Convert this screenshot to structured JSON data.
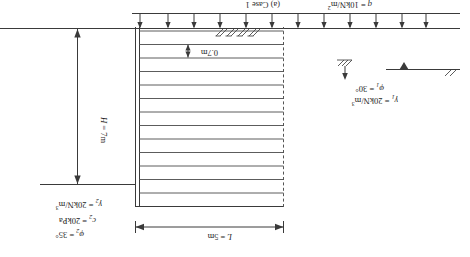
{
  "figure": {
    "caption": "(a) Case 1",
    "type": "reinforced-soil-retaining-wall-cross-section",
    "orientation_note": "180"
  },
  "dimensions": {
    "length_label": "L = 5m",
    "length_value": 5,
    "length_unit": "m",
    "height_label": "H = 7m",
    "height_value": 7,
    "height_unit": "m",
    "spacing_label": "0.7m",
    "spacing_value": 0.7,
    "spacing_unit": "m",
    "reinforcement_layers": 13
  },
  "loads": {
    "surcharge_symbol": "q",
    "surcharge_equals": "=",
    "surcharge_value": "10kN/m",
    "surcharge_exponent": "2",
    "surcharge_full": "q = 10kN/m2",
    "arrow_count": 12,
    "arrow_direction": "up"
  },
  "soil_layer_1": {
    "unit_weight_symbol": "γ",
    "unit_weight_sub": "1",
    "unit_weight_value": "20kN/m",
    "unit_weight_exponent": "3",
    "friction_symbol": "φ",
    "friction_sub": "1",
    "friction_value": "30",
    "friction_unit": "°",
    "unit_weight_full": "γ1 = 20kN/m3",
    "friction_full": "φ1 = 30°"
  },
  "soil_layer_2": {
    "unit_weight_symbol": "γ",
    "unit_weight_sub": "2",
    "unit_weight_value": "20kN/m",
    "unit_weight_exponent": "3",
    "cohesion_symbol": "c",
    "cohesion_sub": "2",
    "cohesion_value": "20kPa",
    "friction_symbol": "φ",
    "friction_sub": "2",
    "friction_value": "35",
    "friction_unit": "°",
    "unit_weight_full": "γ2 = 20kN/m3",
    "cohesion_full": "c2 = 20kPa",
    "friction_full": "φ2 = 35°"
  },
  "equals": "=",
  "icons": {
    "ground_hatch": "ground-hatch-icon",
    "water_table": "water-table-icon",
    "dim_arrow": "dimension-arrow-icon",
    "load_arrow": "load-arrow-icon"
  },
  "colors": {
    "line": "#3a3a3a",
    "thin_line": "#4a4a4a",
    "dash_line": "#555555",
    "text": "#1d1d1d",
    "background": "#ffffff"
  }
}
